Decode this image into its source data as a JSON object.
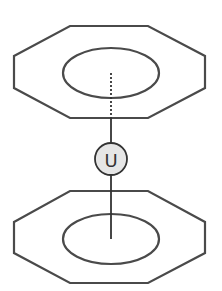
{
  "diagram": {
    "title": "",
    "colors": {
      "stroke": "#4a4a4a",
      "atom_fill": "#e6e6e6",
      "background": "#ffffff"
    },
    "top_ring": {
      "shape": "octagon",
      "points": "14,56 70,26 148,26 205,56 205,88 148,118 70,118 14,88",
      "inner_ellipse": {
        "cx": 111,
        "cy": 73,
        "rx": 48,
        "ry": 25
      }
    },
    "bottom_ring": {
      "shape": "octagon",
      "points": "14,222 70,191 148,191 205,222 205,253 148,283 70,283 14,253",
      "inner_ellipse": {
        "cx": 111,
        "cy": 239,
        "rx": 48,
        "ry": 25
      }
    },
    "center_atom": {
      "label": "U",
      "cx": 111,
      "cy": 159,
      "r": 16
    },
    "bonds": [
      {
        "style": "dotted",
        "x1": 111,
        "y1": 73,
        "x2": 111,
        "y2": 118
      },
      {
        "style": "solid",
        "x1": 111,
        "y1": 118,
        "x2": 111,
        "y2": 143
      },
      {
        "style": "solid",
        "x1": 111,
        "y1": 175,
        "x2": 111,
        "y2": 239
      }
    ]
  }
}
